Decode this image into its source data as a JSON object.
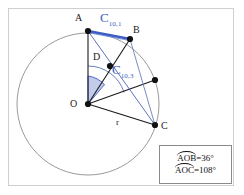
{
  "figure": {
    "type": "geometry-diagram",
    "title_text": "",
    "background": "#ffffff",
    "border_color": "#cfcfcf"
  },
  "colors": {
    "stroke_black": "#1a1a1a",
    "stroke_circle": "#9a9a9a",
    "accent_blue": "#3b5ec4",
    "wedge_fill": "#8fa2d8",
    "arc_gray": "#6f7fb5",
    "legend_border": "#8a8a8a"
  },
  "circle": {
    "center_label": "O",
    "cx": 88,
    "cy": 104,
    "r": 71,
    "radius_label": "r"
  },
  "points": [
    {
      "id": "A",
      "label": "A",
      "x": 88,
      "y": 31,
      "label_x": 75,
      "label_y": 13,
      "on_circle": true
    },
    {
      "id": "B",
      "label": "B",
      "x": 130,
      "y": 39,
      "label_x": 133,
      "label_y": 25,
      "on_circle": true
    },
    {
      "id": "P",
      "label": "",
      "x": 155,
      "y": 80,
      "label_x": 0,
      "label_y": 0,
      "on_circle": true
    },
    {
      "id": "C",
      "label": "C",
      "x": 155,
      "y": 125,
      "label_x": 160,
      "label_y": 125,
      "on_circle": true
    },
    {
      "id": "D",
      "label": "D",
      "x": 110,
      "y": 66,
      "label_x": 93,
      "label_y": 53,
      "on_circle": false
    },
    {
      "id": "O",
      "label": "O",
      "x": 88,
      "y": 104,
      "label_x": 72,
      "label_y": 99,
      "on_circle": false
    }
  ],
  "chord_labels": [
    {
      "id": "c101",
      "base": "C",
      "sub": "10,1",
      "x": 101,
      "y": 11,
      "color": "#3b5ec4"
    },
    {
      "id": "c103",
      "base": "C",
      "sub": "10,3",
      "x": 113,
      "y": 64,
      "color": "#3b5ec4"
    }
  ],
  "segments": [
    {
      "name": "O-A",
      "from": "O",
      "to": "A",
      "color": "#1a1a1a",
      "width": 1.1
    },
    {
      "name": "O-B",
      "from": "O",
      "to": "B",
      "color": "#1a1a1a",
      "width": 1.1
    },
    {
      "name": "O-C",
      "from": "O",
      "to": "C",
      "color": "#1a1a1a",
      "width": 1.1
    },
    {
      "name": "O-P",
      "from": "O",
      "to": "P",
      "color": "#1a1a1a",
      "width": 1.1
    },
    {
      "name": "A-B-chord",
      "from": "A",
      "to": "B",
      "color": "#3b5ec4",
      "width": 2.2
    },
    {
      "name": "A-C-chord",
      "from": "A",
      "to": "C",
      "color": "#4a63b5",
      "width": 0.9
    },
    {
      "name": "B-C-chord",
      "from": "B",
      "to": "C",
      "color": "#6b7fc0",
      "width": 0.9
    }
  ],
  "angles": [
    {
      "name": "AOB",
      "vertex": "O",
      "value_deg": 36,
      "fill": true
    },
    {
      "name": "AOC",
      "vertex": "O",
      "value_deg": 108,
      "fill": false
    }
  ],
  "legend": {
    "rows": [
      {
        "id": "aob",
        "arc_text": "AOB",
        "equals": " = ",
        "value": "36°"
      },
      {
        "id": "aoc",
        "arc_text": "AOC",
        "equals": " = ",
        "value": "108°"
      }
    ]
  }
}
